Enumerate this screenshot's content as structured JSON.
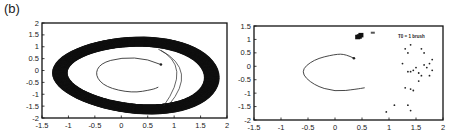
{
  "panel_label": "(b)",
  "chart_data": [
    {
      "type": "line",
      "title": "",
      "xlabel": "",
      "ylabel": "",
      "xlim": [
        -1.5,
        2
      ],
      "ylim": [
        -2,
        2
      ],
      "x_ticks": [
        "-1.5",
        "-1",
        "-0.5",
        "0",
        "0.5",
        "1",
        "1.5",
        "2"
      ],
      "y_ticks": [
        "2",
        "1.5",
        "1",
        "0.5",
        "0",
        "-0.5",
        "-1",
        "-1.5",
        "-2"
      ],
      "grid": false,
      "series": [
        {
          "name": "limit-cycle-band",
          "description": "dense trajectory band forming an oval attractor",
          "outer_extent": {
            "x": [
              -1.35,
              1.8
            ],
            "y": [
              -1.8,
              1.4
            ]
          },
          "inner_extent": {
            "x": [
              -1.1,
              1.5
            ],
            "y": [
              -1.4,
              1.05
            ]
          }
        },
        {
          "name": "inner-spiral",
          "description": "thin spiral arc ending at a point",
          "points": [
            [
              0.75,
              0.25
            ],
            [
              0.5,
              0.5
            ],
            [
              0.0,
              0.55
            ],
            [
              -0.4,
              0.3
            ],
            [
              -0.5,
              -0.2
            ],
            [
              -0.3,
              -0.7
            ],
            [
              0.2,
              -0.95
            ],
            [
              0.6,
              -0.8
            ],
            [
              0.7,
              -0.7
            ]
          ]
        }
      ]
    },
    {
      "type": "scatter",
      "title": "",
      "xlabel": "",
      "ylabel": "",
      "xlim": [
        -1.5,
        2
      ],
      "ylim": [
        -2,
        1.5
      ],
      "x_ticks": [
        "-1.5",
        "-1",
        "-0.5",
        "0",
        "0.5",
        "1",
        "1.5",
        "2"
      ],
      "y_ticks": [
        "1.5",
        "1",
        "0.5",
        "0",
        "-0.5",
        "-1",
        "-1.5",
        "-2"
      ],
      "grid": false,
      "annotation": "T0 = 1 brush",
      "series": [
        {
          "name": "inner-spiral",
          "points": [
            [
              0.35,
              0.3
            ],
            [
              0.2,
              0.45
            ],
            [
              0.0,
              0.45
            ],
            [
              -0.4,
              0.25
            ],
            [
              -0.65,
              -0.2
            ],
            [
              -0.4,
              -0.7
            ],
            [
              0.0,
              -0.95
            ],
            [
              0.4,
              -0.85
            ],
            [
              0.55,
              -0.8
            ]
          ]
        },
        {
          "name": "cluster",
          "points": [
            [
              0.45,
              1.1
            ],
            [
              0.48,
              1.15
            ],
            [
              0.42,
              1.08
            ],
            [
              0.7,
              1.25
            ]
          ]
        },
        {
          "name": "scattered-points",
          "points": [
            [
              1.4,
              0.8
            ],
            [
              1.3,
              0.65
            ],
            [
              1.35,
              0.5
            ],
            [
              1.6,
              0.65
            ],
            [
              1.65,
              0.5
            ],
            [
              1.25,
              0.1
            ],
            [
              1.65,
              0.05
            ],
            [
              1.8,
              0.25
            ],
            [
              1.75,
              0.1
            ],
            [
              1.7,
              -0.05
            ],
            [
              1.5,
              -0.05
            ],
            [
              1.45,
              -0.15
            ],
            [
              1.35,
              -0.2
            ],
            [
              1.4,
              -0.2
            ],
            [
              1.55,
              -0.25
            ],
            [
              1.6,
              -0.35
            ],
            [
              1.75,
              -0.35
            ],
            [
              1.8,
              -0.15
            ],
            [
              1.55,
              -0.55
            ],
            [
              1.3,
              -0.8
            ],
            [
              1.4,
              -0.85
            ],
            [
              1.45,
              -0.9
            ],
            [
              1.1,
              -1.45
            ],
            [
              1.35,
              -1.45
            ],
            [
              0.95,
              -1.7
            ],
            [
              1.4,
              -1.65
            ]
          ]
        }
      ]
    }
  ]
}
